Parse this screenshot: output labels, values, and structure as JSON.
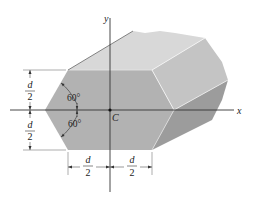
{
  "figure": {
    "axes": {
      "x_label": "x",
      "y_label": "y"
    },
    "centroid_label": "C",
    "angles": {
      "upper": "60°",
      "lower": "60°"
    },
    "dimensions": {
      "vertical_upper": {
        "numerator": "d",
        "denominator": "2"
      },
      "vertical_lower": {
        "numerator": "d",
        "denominator": "2"
      },
      "horizontal_left": {
        "numerator": "d",
        "denominator": "2"
      },
      "horizontal_right": {
        "numerator": "d",
        "denominator": "2"
      }
    },
    "colors": {
      "front_face": "#b4b4b4",
      "top_face": "#d8d8d8",
      "upper_right_face": "#c4c4c4",
      "lower_right_face": "#9a9a9a",
      "edge_highlight": "#f2f2f2",
      "axis": "#333333",
      "dimension_line": "#555555"
    }
  }
}
